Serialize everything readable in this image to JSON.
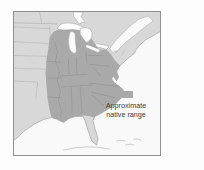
{
  "legend": {
    "swatch_color": "#a9a9a9",
    "label_line1": "Approximate",
    "label_line2": "native range"
  },
  "map_colors": {
    "land": "#d8d8d8",
    "native_range": "#a9a9a9",
    "water": "#f9f9f9",
    "frame_border": "#8f8f8f"
  }
}
